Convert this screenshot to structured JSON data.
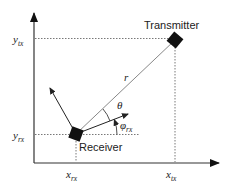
{
  "diagram": {
    "type": "geometry",
    "nodes": {
      "transmitter": {
        "label": "Transmitter",
        "x": 175,
        "y": 40
      },
      "receiver": {
        "label": "Receiver",
        "x": 76,
        "y": 134
      }
    },
    "axes": {
      "y_ticks": [
        {
          "base": "y",
          "sub": "tx"
        },
        {
          "base": "y",
          "sub": "rx"
        }
      ],
      "x_ticks": [
        {
          "base": "x",
          "sub": "rx"
        },
        {
          "base": "x",
          "sub": "tx"
        }
      ]
    },
    "labels": {
      "distance": "r",
      "theta": "θ",
      "phi_base": "φ",
      "phi_sub": "rx"
    },
    "colors": {
      "line": "#222222",
      "ray": "#888888",
      "dashed": "#555555",
      "node": "#111111"
    }
  }
}
